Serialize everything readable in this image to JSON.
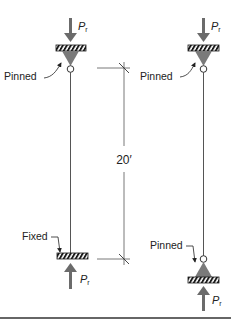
{
  "diagram": {
    "title": "",
    "colors": {
      "line": "#555555",
      "arrow": "#6b6b6b",
      "support_fill": "#7a7a7a",
      "hatch_dark": "#1a1a1a",
      "text": "#222222",
      "rule": "#333333"
    },
    "left_column": {
      "top_support_label": "Pinned",
      "bottom_support_label": "Fixed",
      "load_symbol": "P",
      "load_subscript": "r"
    },
    "right_column": {
      "top_support_label": "Pinned",
      "bottom_support_label": "Pinned",
      "load_symbol": "P",
      "load_subscript": "r"
    },
    "dimension": {
      "label": "20′"
    }
  }
}
